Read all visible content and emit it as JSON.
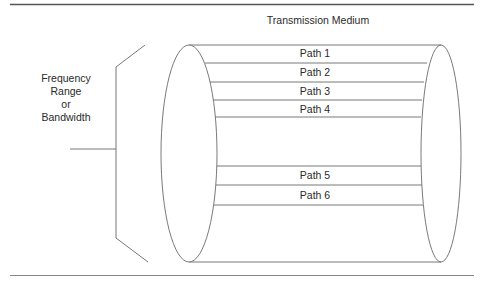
{
  "diagram": {
    "title": "Transmission Medium",
    "left_label": {
      "line1": "Frequency Range",
      "line2": "or",
      "line3": "Bandwidth"
    },
    "paths": [
      {
        "label": "Path 1"
      },
      {
        "label": "Path 2"
      },
      {
        "label": "Path 3"
      },
      {
        "label": "Path 4"
      },
      {
        "label": "Path 5"
      },
      {
        "label": "Path 6"
      }
    ],
    "colors": {
      "line": "#6a6a6a",
      "rule": "#555555",
      "text": "#2a2a2a"
    }
  }
}
